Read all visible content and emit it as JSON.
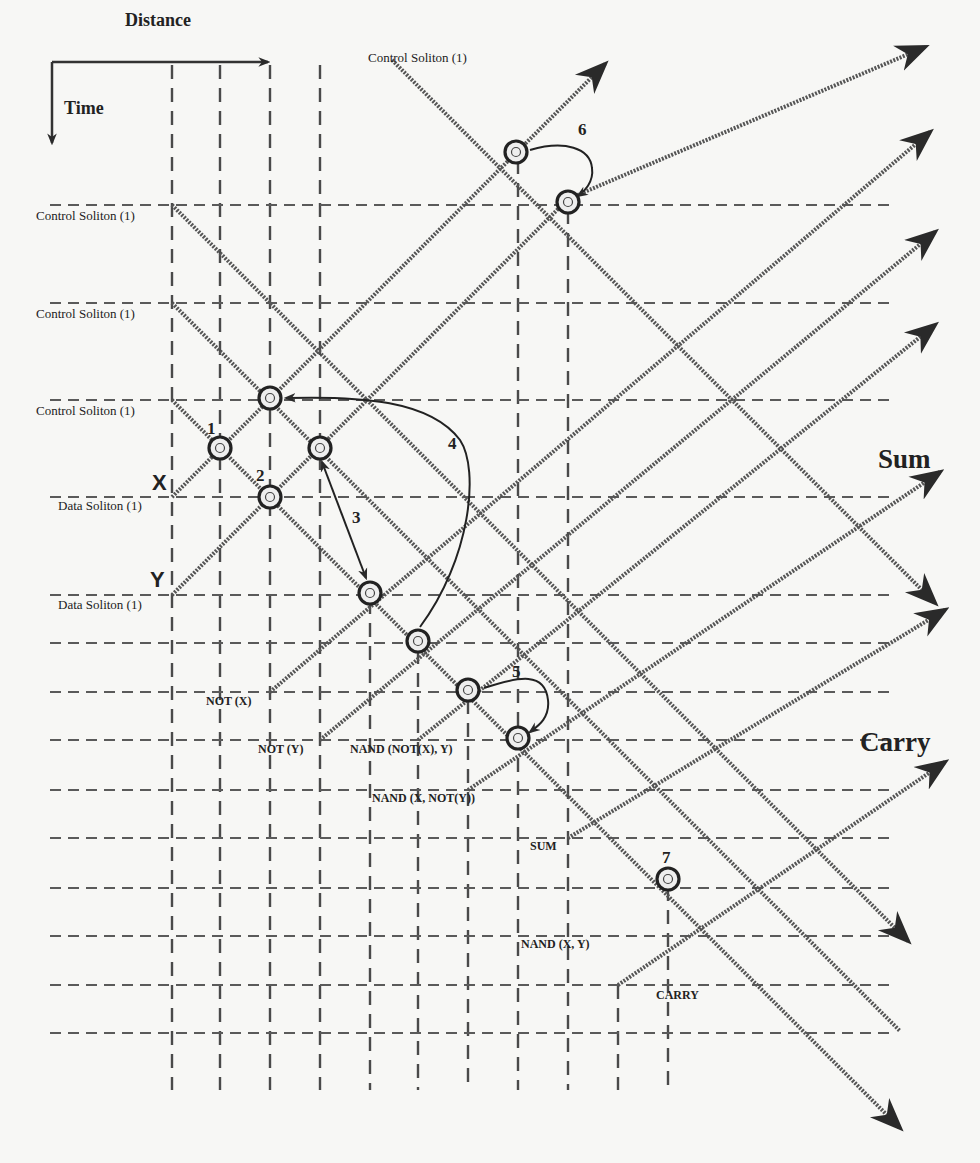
{
  "axes": {
    "distance_label": "Distance",
    "time_label": "Time"
  },
  "inputs": {
    "x_label": "X",
    "y_label": "Y"
  },
  "soliton_labels": {
    "control_top": "Control Soliton (1)",
    "control_1": "Control Soliton (1)",
    "control_2": "Control Soliton (1)",
    "control_3": "Control Soliton (1)",
    "data_x": "Data Soliton (1)",
    "data_y": "Data Soliton (1)"
  },
  "collision_numbers": {
    "n1": "1",
    "n2": "2",
    "n3": "3",
    "n4": "4",
    "n5": "5",
    "n6": "6",
    "n7": "7"
  },
  "gate_labels": {
    "not_x": "NOT (X)",
    "not_y": "NOT (Y)",
    "nand_notx_y": "NAND (NOT(X), Y)",
    "nand_x_noty": "NAND (X, NOT(Y))",
    "sum": "SUM",
    "nand_x_y": "NAND (X, Y)",
    "carry": "CARRY"
  },
  "outputs": {
    "sum": "Sum",
    "carry": "Carry"
  },
  "geometry": {
    "vertical_lines": [
      {
        "x": 172,
        "y1": 65,
        "y2": 1090
      },
      {
        "x": 220,
        "y1": 65,
        "y2": 1090
      },
      {
        "x": 270,
        "y1": 65,
        "y2": 1090
      },
      {
        "x": 320,
        "y1": 65,
        "y2": 1090
      },
      {
        "x": 370,
        "y1": 600,
        "y2": 1090
      },
      {
        "x": 418,
        "y1": 650,
        "y2": 1090
      },
      {
        "x": 468,
        "y1": 700,
        "y2": 1090
      },
      {
        "x": 518,
        "y1": 160,
        "y2": 1090
      },
      {
        "x": 568,
        "y1": 210,
        "y2": 1090
      },
      {
        "x": 618,
        "y1": 985,
        "y2": 1090
      },
      {
        "x": 668,
        "y1": 887,
        "y2": 1090
      }
    ],
    "horizontal_lines": [
      {
        "y": 205,
        "x1": 50,
        "x2": 890
      },
      {
        "y": 303,
        "x1": 50,
        "x2": 890
      },
      {
        "y": 400,
        "x1": 50,
        "x2": 890
      },
      {
        "y": 497,
        "x1": 50,
        "x2": 890
      },
      {
        "y": 595,
        "x1": 50,
        "x2": 890
      },
      {
        "y": 643,
        "x1": 50,
        "x2": 890
      },
      {
        "y": 692,
        "x1": 50,
        "x2": 890
      },
      {
        "y": 740,
        "x1": 50,
        "x2": 890
      },
      {
        "y": 790,
        "x1": 50,
        "x2": 890
      },
      {
        "y": 838,
        "x1": 50,
        "x2": 890
      },
      {
        "y": 888,
        "x1": 50,
        "x2": 890
      },
      {
        "y": 936,
        "x1": 50,
        "x2": 890
      },
      {
        "y": 985,
        "x1": 50,
        "x2": 890
      },
      {
        "y": 1033,
        "x1": 50,
        "x2": 890
      }
    ],
    "solitons": [
      {
        "x1": 172,
        "y1": 497,
        "x2": 605,
        "y2": 64,
        "arrow": true
      },
      {
        "x1": 172,
        "y1": 595,
        "x2": 568,
        "y2": 199,
        "arrow": false
      },
      {
        "x1": 568,
        "y1": 199,
        "x2": 925,
        "y2": 47,
        "arrow": true,
        "bend": true
      },
      {
        "x1": 270,
        "y1": 692,
        "x2": 930,
        "y2": 132,
        "arrow": true,
        "bend": true
      },
      {
        "x1": 320,
        "y1": 740,
        "x2": 935,
        "y2": 232,
        "arrow": true,
        "bend": true
      },
      {
        "x1": 418,
        "y1": 740,
        "x2": 935,
        "y2": 325,
        "arrow": true,
        "bend": true
      },
      {
        "x1": 468,
        "y1": 790,
        "x2": 940,
        "y2": 472,
        "arrow": true,
        "bend": true
      },
      {
        "x1": 568,
        "y1": 838,
        "x2": 945,
        "y2": 610,
        "arrow": true,
        "bend": true
      },
      {
        "x1": 618,
        "y1": 985,
        "x2": 945,
        "y2": 762,
        "arrow": true,
        "bend": true
      },
      {
        "x1": 172,
        "y1": 205,
        "x2": 908,
        "y2": 941,
        "arrow": true
      },
      {
        "x1": 172,
        "y1": 303,
        "x2": 900,
        "y2": 1031,
        "arrow": false
      },
      {
        "x1": 172,
        "y1": 400,
        "x2": 900,
        "y2": 1128,
        "arrow": true
      },
      {
        "x1": 392,
        "y1": 60,
        "x2": 935,
        "y2": 603,
        "arrow": true
      }
    ],
    "collisions": [
      {
        "x": 220,
        "y": 448
      },
      {
        "x": 270,
        "y": 497
      },
      {
        "x": 270,
        "y": 398
      },
      {
        "x": 320,
        "y": 448
      },
      {
        "x": 370,
        "y": 593
      },
      {
        "x": 418,
        "y": 641
      },
      {
        "x": 468,
        "y": 690
      },
      {
        "x": 518,
        "y": 738
      },
      {
        "x": 516,
        "y": 152
      },
      {
        "x": 568,
        "y": 202
      },
      {
        "x": 668,
        "y": 879
      }
    ]
  },
  "colors": {
    "background": "#f7f7f5",
    "line": "#555555",
    "ink": "#222222"
  }
}
